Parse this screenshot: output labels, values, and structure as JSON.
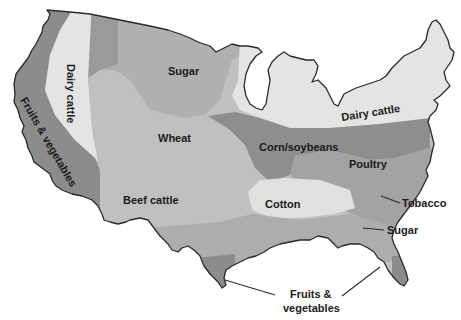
{
  "map": {
    "title": "",
    "colors": {
      "fruits_vegetables": "#8c8c8c",
      "dairy_cattle": "#e4e4e4",
      "dark_band": "#9a9a9a",
      "sugar_north": "#b0b0b0",
      "wheat": "#c2c2c2",
      "beef_cattle": "#bdbdbd",
      "corn_soybeans": "#8e8e8e",
      "poultry": "#a3a3a3",
      "cotton": "#e0e0e0",
      "sugar_south": "#ababab",
      "water": "#ffffff",
      "outline": "#2a2a2a"
    },
    "regions": [
      {
        "id": "fruits-vegetables-west",
        "label": "Fruits & vegetables"
      },
      {
        "id": "dairy-cattle-west",
        "label": "Dairy cattle"
      },
      {
        "id": "sugar-north",
        "label": "Sugar"
      },
      {
        "id": "wheat",
        "label": "Wheat"
      },
      {
        "id": "beef-cattle",
        "label": "Beef cattle"
      },
      {
        "id": "corn-soybeans",
        "label": "Corn/soybeans"
      },
      {
        "id": "dairy-cattle-east",
        "label": "Dairy cattle"
      },
      {
        "id": "poultry",
        "label": "Poultry"
      },
      {
        "id": "cotton",
        "label": "Cotton"
      },
      {
        "id": "tobacco",
        "label": "Tobacco"
      },
      {
        "id": "sugar-south",
        "label": "Sugar"
      },
      {
        "id": "fruits-vegetables-south",
        "label_line1": "Fruits &",
        "label_line2": "vegetables"
      }
    ]
  }
}
